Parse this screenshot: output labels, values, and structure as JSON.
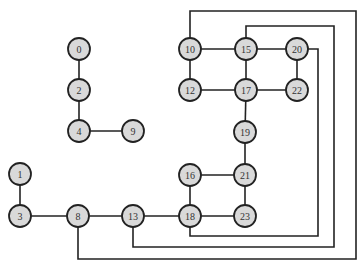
{
  "diagram": {
    "type": "graph",
    "node_radius": 11,
    "colors": {
      "node_fill": "#d9d9d9",
      "node_stroke": "#222222",
      "edge": "#222222",
      "label": "#333333",
      "background": "#ffffff"
    },
    "nodes": [
      {
        "id": "0",
        "label": "0",
        "x": 79,
        "y": 49
      },
      {
        "id": "2",
        "label": "2",
        "x": 79,
        "y": 90
      },
      {
        "id": "4",
        "label": "4",
        "x": 79,
        "y": 131
      },
      {
        "id": "9",
        "label": "9",
        "x": 133,
        "y": 131
      },
      {
        "id": "1",
        "label": "1",
        "x": 20,
        "y": 174
      },
      {
        "id": "3",
        "label": "3",
        "x": 20,
        "y": 216
      },
      {
        "id": "8",
        "label": "8",
        "x": 78,
        "y": 216
      },
      {
        "id": "13",
        "label": "13",
        "x": 133,
        "y": 216
      },
      {
        "id": "18",
        "label": "18",
        "x": 190,
        "y": 216
      },
      {
        "id": "23",
        "label": "23",
        "x": 245,
        "y": 216
      },
      {
        "id": "16",
        "label": "16",
        "x": 190,
        "y": 175
      },
      {
        "id": "21",
        "label": "21",
        "x": 245,
        "y": 175
      },
      {
        "id": "19",
        "label": "19",
        "x": 245,
        "y": 132
      },
      {
        "id": "10",
        "label": "10",
        "x": 190,
        "y": 49
      },
      {
        "id": "15",
        "label": "15",
        "x": 246,
        "y": 49
      },
      {
        "id": "20",
        "label": "20",
        "x": 297,
        "y": 49
      },
      {
        "id": "12",
        "label": "12",
        "x": 190,
        "y": 90
      },
      {
        "id": "17",
        "label": "17",
        "x": 246,
        "y": 90
      },
      {
        "id": "22",
        "label": "22",
        "x": 297,
        "y": 90
      }
    ],
    "edges": [
      {
        "from": "0",
        "to": "2",
        "points": [
          [
            79,
            49
          ],
          [
            79,
            90
          ]
        ]
      },
      {
        "from": "2",
        "to": "4",
        "points": [
          [
            79,
            90
          ],
          [
            79,
            131
          ]
        ]
      },
      {
        "from": "4",
        "to": "9",
        "points": [
          [
            79,
            131
          ],
          [
            133,
            131
          ]
        ]
      },
      {
        "from": "1",
        "to": "3",
        "points": [
          [
            20,
            174
          ],
          [
            20,
            216
          ]
        ]
      },
      {
        "from": "3",
        "to": "8",
        "points": [
          [
            20,
            216
          ],
          [
            78,
            216
          ]
        ]
      },
      {
        "from": "8",
        "to": "13",
        "points": [
          [
            78,
            216
          ],
          [
            133,
            216
          ]
        ]
      },
      {
        "from": "13",
        "to": "18",
        "points": [
          [
            133,
            216
          ],
          [
            190,
            216
          ]
        ]
      },
      {
        "from": "18",
        "to": "23",
        "points": [
          [
            190,
            216
          ],
          [
            245,
            216
          ]
        ]
      },
      {
        "from": "16",
        "to": "18",
        "points": [
          [
            190,
            175
          ],
          [
            190,
            216
          ]
        ]
      },
      {
        "from": "16",
        "to": "21",
        "points": [
          [
            190,
            175
          ],
          [
            245,
            175
          ]
        ]
      },
      {
        "from": "21",
        "to": "23",
        "points": [
          [
            245,
            175
          ],
          [
            245,
            216
          ]
        ]
      },
      {
        "from": "19",
        "to": "21",
        "points": [
          [
            245,
            132
          ],
          [
            245,
            175
          ]
        ]
      },
      {
        "from": "17",
        "to": "19",
        "points": [
          [
            246,
            90
          ],
          [
            245,
            132
          ]
        ]
      },
      {
        "from": "10",
        "to": "15",
        "points": [
          [
            190,
            49
          ],
          [
            246,
            49
          ]
        ]
      },
      {
        "from": "15",
        "to": "20",
        "points": [
          [
            246,
            49
          ],
          [
            297,
            49
          ]
        ]
      },
      {
        "from": "10",
        "to": "12",
        "points": [
          [
            190,
            49
          ],
          [
            190,
            90
          ]
        ]
      },
      {
        "from": "15",
        "to": "17",
        "points": [
          [
            246,
            49
          ],
          [
            246,
            90
          ]
        ]
      },
      {
        "from": "20",
        "to": "22",
        "points": [
          [
            297,
            49
          ],
          [
            297,
            90
          ]
        ]
      },
      {
        "from": "12",
        "to": "17",
        "points": [
          [
            190,
            90
          ],
          [
            246,
            90
          ]
        ]
      },
      {
        "from": "17",
        "to": "22",
        "points": [
          [
            246,
            90
          ],
          [
            297,
            90
          ]
        ]
      },
      {
        "from": "10",
        "to": "8",
        "points": [
          [
            190,
            49
          ],
          [
            190,
            11
          ],
          [
            356,
            11
          ],
          [
            356,
            259
          ],
          [
            78,
            259
          ],
          [
            78,
            216
          ]
        ]
      },
      {
        "from": "15",
        "to": "13",
        "points": [
          [
            246,
            49
          ],
          [
            246,
            26
          ],
          [
            334,
            26
          ],
          [
            334,
            247
          ],
          [
            133,
            247
          ],
          [
            133,
            216
          ]
        ]
      },
      {
        "from": "20",
        "to": "18",
        "points": [
          [
            297,
            49
          ],
          [
            318,
            49
          ],
          [
            318,
            236
          ],
          [
            190,
            236
          ],
          [
            190,
            216
          ]
        ]
      }
    ]
  }
}
